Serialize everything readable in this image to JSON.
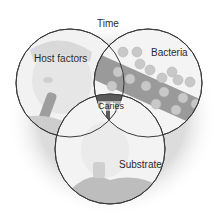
{
  "diagram": {
    "type": "venn",
    "title": "Time",
    "circles": [
      {
        "id": "host",
        "label": "Host factors",
        "cx": 70,
        "cy": 83,
        "r": 54
      },
      {
        "id": "bacteria",
        "label": "Bacteria",
        "cx": 148,
        "cy": 83,
        "r": 54
      },
      {
        "id": "substrate",
        "label": "Substrate",
        "cx": 110,
        "cy": 149,
        "r": 55
      }
    ],
    "intersection_label": "Caries"
  },
  "colors": {
    "outline": "#3a3a3a",
    "text": "#2a2a2a",
    "shadow": "#d9d9d9",
    "bacteria_band": "#9a9a9a",
    "bacteria_dot": "#c8c8c8"
  }
}
